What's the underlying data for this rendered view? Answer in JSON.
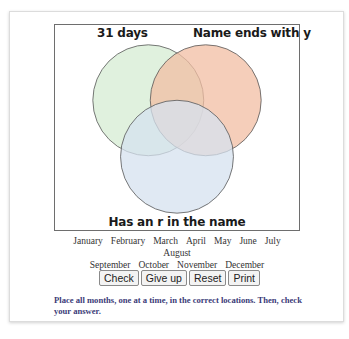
{
  "venn": {
    "sets": [
      {
        "label": "31 days",
        "color": "#d6ecd3"
      },
      {
        "label": "Name ends with y",
        "color": "#f2bea3"
      },
      {
        "label": "Has an r in the name",
        "color": "#d5e2ef"
      }
    ],
    "stroke_color": "#555555"
  },
  "months": [
    "January",
    "February",
    "March",
    "April",
    "May",
    "June",
    "July",
    "August",
    "September",
    "October",
    "November",
    "December"
  ],
  "buttons": {
    "check": "Check",
    "give_up": "Give up",
    "reset": "Reset",
    "print": "Print"
  },
  "instructions": "Place all months, one at a time, in the correct locations. Then, check your answer."
}
